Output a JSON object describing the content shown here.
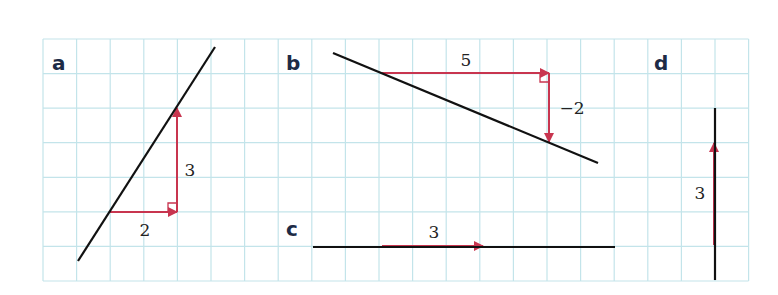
{
  "figure": {
    "grid": {
      "x0": 43,
      "y0": 39,
      "cols": 21,
      "rows": 7,
      "dx": 33.6,
      "dy": 34.57,
      "color": "#c3e4ea"
    },
    "colors": {
      "line": "#111111",
      "vector": "#c8354f",
      "label": "#1d2b46"
    },
    "panels": [
      {
        "id": "a",
        "label": "a",
        "label_pos": [
          52,
          70
        ],
        "line": [
          78,
          261,
          215,
          47
        ],
        "vectors": [
          {
            "from": [
              110,
              212
            ],
            "to": [
              177,
              212
            ],
            "text": "2",
            "text_pos": [
              145,
              236
            ]
          },
          {
            "from": [
              177,
              212
            ],
            "to": [
              177,
              108
            ],
            "text": "3",
            "text_pos": [
              190,
              176
            ]
          }
        ],
        "right_angle": [
          177,
          212,
          "left-up"
        ]
      },
      {
        "id": "b",
        "label": "b",
        "label_pos": [
          286,
          70
        ],
        "line": [
          333,
          53,
          598,
          163
        ],
        "vectors": [
          {
            "from": [
              382,
              73
            ],
            "to": [
              549,
              73
            ],
            "text": "5",
            "text_pos": [
              466,
              66
            ]
          },
          {
            "from": [
              549,
              73
            ],
            "to": [
              549,
              142
            ],
            "text": "−2",
            "text_pos": [
              572,
              114
            ]
          }
        ],
        "right_angle": [
          549,
          73,
          "left-down"
        ]
      },
      {
        "id": "c",
        "label": "c",
        "label_pos": [
          286,
          236
        ],
        "line": [
          313,
          247,
          615,
          247
        ],
        "vectors": [
          {
            "from": [
              382,
              246
            ],
            "to": [
              483,
              246
            ],
            "text": "3",
            "text_pos": [
              434,
              238
            ]
          }
        ],
        "right_angle": null
      },
      {
        "id": "d",
        "label": "d",
        "label_pos": [
          654,
          70
        ],
        "line": [
          715,
          108,
          715,
          280
        ],
        "vectors": [
          {
            "from": [
              714,
              245
            ],
            "to": [
              714,
              143
            ],
            "text": "3",
            "text_pos": [
              700,
              199
            ]
          }
        ],
        "right_angle": null
      }
    ]
  }
}
